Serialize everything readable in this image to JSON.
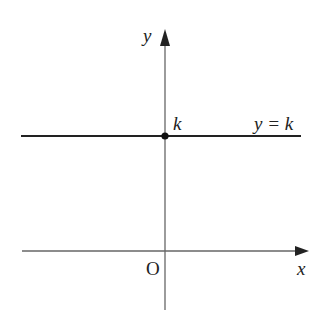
{
  "diagram": {
    "type": "graph-of-horizontal-line",
    "axes": {
      "x_label": "x",
      "y_label": "y",
      "origin_label": "O"
    },
    "line": {
      "equation_label": "y = k",
      "intercept_label": "k"
    },
    "colors": {
      "axis": "#555555",
      "line": "#222222",
      "text": "#222222",
      "background": "#ffffff"
    }
  }
}
